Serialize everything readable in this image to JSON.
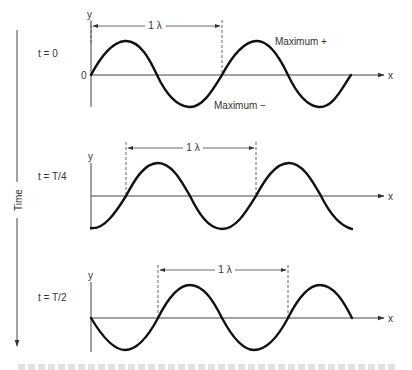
{
  "figure": {
    "time_axis_label": "Time",
    "panels": [
      {
        "time_label": "t = 0",
        "y_label": "y",
        "x_label": "x",
        "origin_label": "0",
        "wavelength_label": "1 λ",
        "annotations": [
          "Maximum +",
          "Maximum −"
        ]
      },
      {
        "time_label": "t = T/4",
        "y_label": "y",
        "x_label": "x",
        "wavelength_label": "1 λ"
      },
      {
        "time_label": "t = T/2",
        "y_label": "y",
        "x_label": "x",
        "wavelength_label": "1 λ"
      }
    ],
    "caption_visible": "partially cut off, unreadable"
  }
}
